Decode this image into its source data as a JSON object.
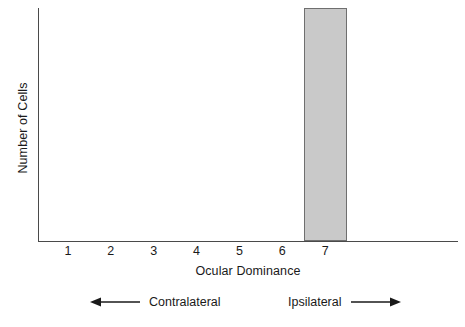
{
  "chart_data": {
    "type": "bar",
    "title": "",
    "subtitle": "",
    "xlabel": "Ocular Dominance",
    "ylabel": "Number of Cells",
    "categories": [
      "1",
      "2",
      "3",
      "4",
      "5",
      "6",
      "7"
    ],
    "values": [
      0,
      0,
      0,
      0,
      0,
      0,
      100
    ],
    "ylim": [
      0,
      100
    ],
    "xlim": [
      0.3,
      10.1
    ],
    "grid": false,
    "legend": null,
    "tick_labels_x": [
      "1",
      "2",
      "3",
      "4",
      "5",
      "6",
      "7"
    ],
    "tick_labels_y": [],
    "annotations": [
      {
        "text": "Contralateral",
        "arrow": "left"
      },
      {
        "text": "Ipsilateral",
        "arrow": "right"
      }
    ],
    "colors": {
      "bar_fill": "#c9c9c9",
      "bar_edge": "#6f6f6f",
      "axis": "#4a4a4a",
      "text": "#1a1a1a",
      "background": "#ffffff"
    }
  }
}
